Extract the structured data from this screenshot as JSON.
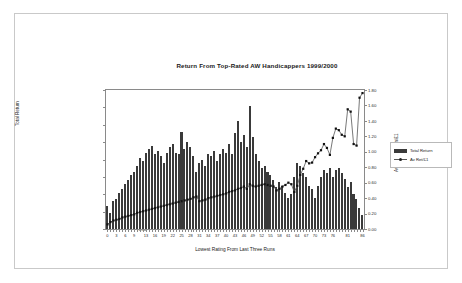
{
  "window": {
    "background": "#ffffff",
    "border_color": "#c9c9c9"
  },
  "chart_data": {
    "type": "bar",
    "title": "Return From Top-Rated AW Handicappers 1999/2000",
    "xlabel": "Lowest Rating From Last Three Runs",
    "ylabel": "Total Return",
    "y2label": "Average Return/£1",
    "grid": false,
    "legend_position": "right",
    "ylim": [
      0,
      80
    ],
    "y2lim": [
      0,
      1.8
    ],
    "xlim": [
      0,
      87
    ],
    "yticks": [
      "0.00",
      "10.00",
      "20.00",
      "30.00",
      "40.00",
      "50.00",
      "60.00",
      "70.00",
      "80.00"
    ],
    "y2ticks": [
      "0.00",
      "0.20",
      "0.40",
      "0.60",
      "0.80",
      "1.00",
      "1.20",
      "1.40",
      "1.60",
      "1.80"
    ],
    "xticks": [
      "0",
      "3",
      "6",
      "9",
      "13",
      "16",
      "19",
      "22",
      "25",
      "28",
      "31",
      "34",
      "37",
      "40",
      "43",
      "46",
      "49",
      "52",
      "55",
      "58",
      "61",
      "64",
      "67",
      "70",
      "73",
      "76",
      "81",
      "86"
    ],
    "categories": [
      0,
      1,
      2,
      3,
      4,
      5,
      6,
      7,
      8,
      9,
      10,
      11,
      12,
      13,
      14,
      15,
      16,
      17,
      18,
      19,
      20,
      21,
      22,
      23,
      24,
      25,
      26,
      27,
      28,
      29,
      30,
      31,
      32,
      33,
      34,
      35,
      36,
      37,
      38,
      39,
      40,
      41,
      42,
      43,
      44,
      45,
      46,
      47,
      48,
      49,
      50,
      51,
      52,
      53,
      54,
      55,
      56,
      57,
      58,
      59,
      60,
      61,
      62,
      63,
      64,
      65,
      66,
      67,
      68,
      69,
      70,
      71,
      72,
      73,
      74,
      75,
      76,
      77,
      78,
      79,
      80,
      81,
      82,
      83,
      84,
      85,
      86
    ],
    "series": [
      {
        "name": "Total Return",
        "axis": "left",
        "color": "#3a3a3a",
        "render": "bar",
        "values": [
          13.0,
          9.0,
          16.0,
          17.0,
          20.5,
          23.0,
          26.0,
          28.0,
          31.0,
          33.0,
          36.0,
          41.0,
          39.0,
          44.0,
          46.0,
          47.5,
          43.0,
          45.0,
          42.0,
          38.0,
          44.0,
          47.0,
          49.0,
          44.0,
          43.0,
          56.0,
          46.0,
          50.0,
          47.0,
          42.0,
          33.0,
          38.0,
          40.0,
          36.0,
          43.0,
          42.0,
          45.0,
          39.0,
          43.0,
          46.0,
          44.0,
          49.0,
          43.0,
          55.0,
          62.0,
          50.0,
          54.0,
          47.0,
          71.0,
          53.0,
          43.0,
          39.0,
          35.0,
          36.0,
          33.0,
          31.0,
          28.0,
          24.0,
          27.0,
          25.0,
          21.0,
          18.0,
          20.0,
          30.0,
          38.0,
          36.0,
          32.0,
          30.0,
          25.0,
          23.0,
          18.0,
          25.0,
          30.0,
          34.0,
          32.0,
          35.0,
          30.0,
          34.0,
          35.0,
          32.0,
          29.0,
          24.0,
          27.0,
          20.0,
          17.0,
          12.0,
          8.0
        ]
      },
      {
        "name": "Av Ret/£1",
        "axis": "right",
        "color": "#555555",
        "render": "line",
        "marker": "square",
        "values": [
          0.06,
          0.09,
          0.11,
          0.12,
          0.13,
          0.15,
          0.16,
          0.17,
          0.18,
          0.19,
          0.21,
          0.22,
          0.23,
          0.24,
          0.25,
          0.26,
          0.27,
          0.28,
          0.29,
          0.3,
          0.31,
          0.32,
          0.33,
          0.34,
          0.35,
          0.36,
          0.37,
          0.38,
          0.39,
          0.41,
          0.42,
          0.36,
          0.37,
          0.38,
          0.4,
          0.41,
          0.42,
          0.43,
          0.44,
          0.45,
          0.46,
          0.48,
          0.49,
          0.5,
          0.52,
          0.53,
          0.55,
          0.52,
          0.58,
          0.56,
          0.55,
          0.56,
          0.57,
          0.58,
          0.57,
          0.56,
          0.55,
          0.5,
          0.52,
          0.55,
          0.57,
          0.6,
          0.58,
          0.48,
          0.56,
          0.7,
          0.78,
          0.88,
          0.85,
          0.86,
          0.93,
          0.98,
          1.02,
          1.1,
          1.05,
          0.96,
          1.18,
          1.3,
          1.28,
          1.22,
          1.2,
          1.55,
          1.52,
          1.1,
          1.08,
          1.7,
          1.76
        ]
      }
    ],
    "legend": [
      {
        "label": "Total Return",
        "type": "bar",
        "color": "#3a3a3a"
      },
      {
        "label": "Av Ret/£1",
        "type": "line-marker",
        "color": "#555555"
      }
    ]
  }
}
